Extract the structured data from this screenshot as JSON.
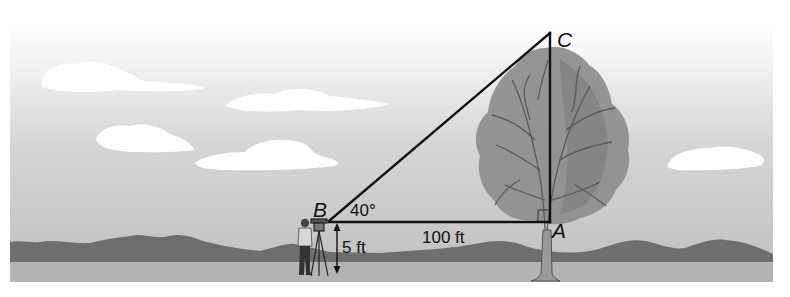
{
  "figure": {
    "vertices": {
      "A": "A",
      "B": "B",
      "C": "C"
    },
    "angle_label": "40°",
    "horizontal_distance_label": "100 ft",
    "instrument_height_label": "5 ft"
  },
  "colors": {
    "sky_top": "#ffffff",
    "sky_bottom": "#bdbdbd",
    "mountains": "#6e6e6e",
    "ground": "#b4b4b4",
    "tree_foliage": "#8c8c8c",
    "lines": "#111111"
  }
}
